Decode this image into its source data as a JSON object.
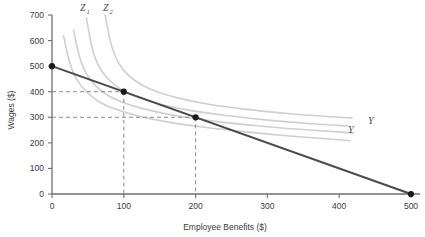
{
  "chart_data": {
    "type": "line",
    "title": "",
    "xlabel": "Employee Benefits ($)",
    "ylabel": "Wages ($)",
    "xlim": [
      0,
      520
    ],
    "ylim": [
      0,
      700
    ],
    "xticks": [
      0,
      100,
      200,
      300,
      400,
      500
    ],
    "xtick_labels": [
      "0",
      "100",
      "200",
      "300",
      "400",
      "500"
    ],
    "yticks": [
      0,
      100,
      200,
      300,
      400,
      500,
      600,
      700
    ],
    "ytick_labels": [
      "0",
      "100",
      "200",
      "300",
      "400",
      "500",
      "600",
      "700"
    ],
    "grid": false,
    "legend_position": "inline-annotations",
    "series": [
      {
        "name": "budget-line",
        "type": "line",
        "kind": "isoprofit-budget-constraint",
        "color": "#4a4a4a",
        "width": 2.0,
        "points": [
          [
            0,
            500
          ],
          [
            500,
            0
          ]
        ]
      },
      {
        "name": "indifference-curve-1",
        "type": "curve",
        "color": "#cfcfcf",
        "width": 1.6,
        "label": "Z1",
        "points": [
          [
            16,
            620
          ],
          [
            24,
            520
          ],
          [
            34,
            450
          ],
          [
            48,
            400
          ],
          [
            66,
            360
          ],
          [
            90,
            330
          ],
          [
            120,
            305
          ],
          [
            160,
            282
          ],
          [
            210,
            262
          ],
          [
            270,
            243
          ],
          [
            330,
            227
          ],
          [
            400,
            212
          ],
          [
            415,
            208
          ]
        ]
      },
      {
        "name": "indifference-curve-2",
        "type": "curve",
        "color": "#cfcfcf",
        "width": 1.6,
        "label": "Z2",
        "points": [
          [
            30,
            640
          ],
          [
            38,
            540
          ],
          [
            48,
            470
          ],
          [
            62,
            420
          ],
          [
            80,
            382
          ],
          [
            105,
            352
          ],
          [
            135,
            328
          ],
          [
            175,
            305
          ],
          [
            225,
            285
          ],
          [
            285,
            267
          ],
          [
            345,
            253
          ],
          [
            408,
            241
          ],
          [
            420,
            239
          ]
        ]
      },
      {
        "name": "indifference-curve-3",
        "type": "curve",
        "color": "#cfcfcf",
        "width": 1.6,
        "label": "Y",
        "points": [
          [
            48,
            688
          ],
          [
            56,
            570
          ],
          [
            66,
            495
          ],
          [
            80,
            445
          ],
          [
            98,
            406
          ],
          [
            122,
            375
          ],
          [
            152,
            350
          ],
          [
            192,
            327
          ],
          [
            242,
            307
          ],
          [
            302,
            289
          ],
          [
            362,
            275
          ],
          [
            412,
            266
          ]
        ]
      },
      {
        "name": "indifference-curve-4",
        "type": "curve",
        "color": "#cfcfcf",
        "width": 1.6,
        "label": "Y",
        "points": [
          [
            74,
            700
          ],
          [
            82,
            590
          ],
          [
            92,
            516
          ],
          [
            106,
            466
          ],
          [
            124,
            428
          ],
          [
            148,
            398
          ],
          [
            178,
            374
          ],
          [
            218,
            351
          ],
          [
            268,
            332
          ],
          [
            328,
            315
          ],
          [
            388,
            302
          ],
          [
            418,
            297
          ]
        ]
      }
    ],
    "markers": [
      {
        "name": "endpoint-wage-intercept",
        "x": 0,
        "y": 500
      },
      {
        "name": "tangency-point-1",
        "x": 100,
        "y": 400
      },
      {
        "name": "tangency-point-2",
        "x": 200,
        "y": 300
      },
      {
        "name": "endpoint-benefit-intercept",
        "x": 500,
        "y": 0
      }
    ],
    "guide_lines": [
      {
        "name": "guide-400",
        "from": [
          0,
          400
        ],
        "to": [
          100,
          400
        ],
        "style": "dashed"
      },
      {
        "name": "guide-100-vertical",
        "from": [
          100,
          400
        ],
        "to": [
          100,
          0
        ],
        "style": "dashed"
      },
      {
        "name": "guide-300",
        "from": [
          0,
          300
        ],
        "to": [
          200,
          300
        ],
        "style": "dashed"
      },
      {
        "name": "guide-200-vertical",
        "from": [
          200,
          300
        ],
        "to": [
          200,
          0
        ],
        "style": "dashed"
      }
    ],
    "annotations": [
      {
        "name": "label-z1",
        "text": "Z",
        "subscript": "1",
        "x": 80,
        "y": 11
      },
      {
        "name": "label-z2",
        "text": "Z",
        "subscript": "2",
        "x": 103,
        "y": 11
      },
      {
        "name": "label-y-upper",
        "text": "Y",
        "x": 368,
        "y": 124
      },
      {
        "name": "label-y-lower",
        "text": "Y",
        "x": 348,
        "y": 133
      }
    ]
  },
  "colors": {
    "axis": "#6e6e6e",
    "budget_line": "#4a4a4a",
    "curve": "#cfcfcf",
    "dashed_guide": "#8a8a8a",
    "marker": "#1a1a1a",
    "text": "#3b3b3b",
    "background": "#ffffff"
  }
}
